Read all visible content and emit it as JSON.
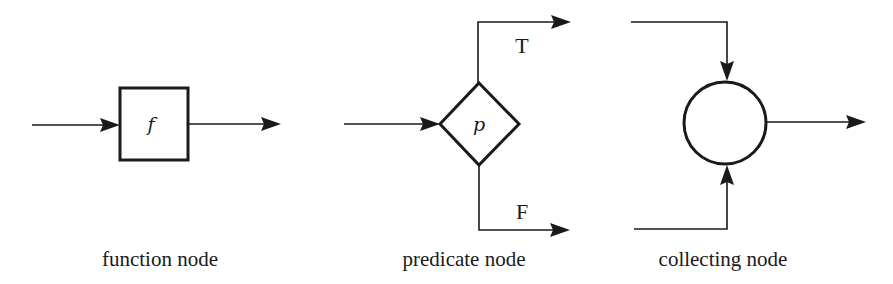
{
  "diagram": {
    "type": "flowchart-node-legend",
    "nodes": [
      {
        "id": "function",
        "shape": "square",
        "symbol": "f",
        "caption": "function node",
        "inputs": 1,
        "outputs": 1
      },
      {
        "id": "predicate",
        "shape": "diamond",
        "symbol": "p",
        "caption": "predicate node",
        "inputs": 1,
        "outputs": 2,
        "branches": [
          {
            "label": "T",
            "position": "top"
          },
          {
            "label": "F",
            "position": "bottom"
          }
        ]
      },
      {
        "id": "collecting",
        "shape": "circle",
        "symbol": "",
        "caption": "collecting node",
        "inputs": 2,
        "outputs": 1
      }
    ],
    "colors": {
      "stroke": "#1a1a1a",
      "background": "#ffffff"
    }
  }
}
